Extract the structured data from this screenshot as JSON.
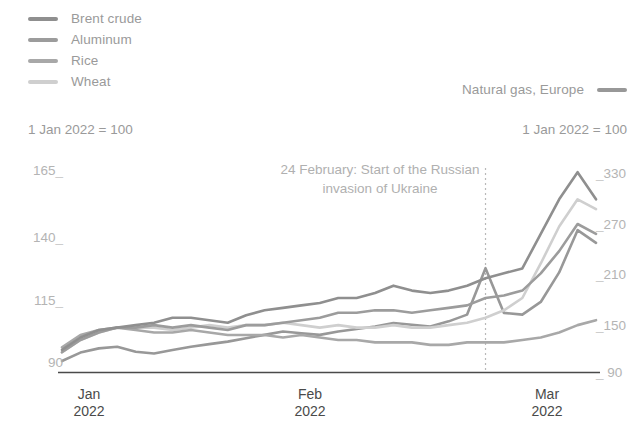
{
  "legend": {
    "left_items": [
      {
        "label": "Brent crude",
        "color": "#8f8f8f"
      },
      {
        "label": "Aluminum",
        "color": "#9c9c9c"
      },
      {
        "label": "Rice",
        "color": "#a8a8a8"
      },
      {
        "label": "Wheat",
        "color": "#cfcfcf"
      }
    ],
    "right_item": {
      "label": "Natural gas, Europe",
      "color": "#989898"
    }
  },
  "axis": {
    "left_header": "1 Jan 2022 = 100",
    "right_header": "1 Jan 2022 = 100",
    "left_ticks": [
      "165",
      "140",
      "115",
      "90"
    ],
    "right_ticks": [
      "330",
      "270",
      "210",
      "150",
      "90"
    ],
    "x_labels": [
      {
        "month": "Jan",
        "year": "2022"
      },
      {
        "month": "Feb",
        "year": "2022"
      },
      {
        "month": "Mar",
        "year": "2022"
      }
    ]
  },
  "annotation": {
    "line1": "24 February: Start of the Russian",
    "line2": "invasion of Ukraine"
  },
  "chart_data": {
    "type": "line",
    "title": "",
    "xlabel": "",
    "ylabel": "1 Jan 2022 = 100",
    "grid": false,
    "legend_position": "top-left",
    "ylim_left": [
      82,
      172
    ],
    "ylim_right": [
      82,
      345
    ],
    "left_axis_ticks": [
      90,
      115,
      140,
      165
    ],
    "right_axis_ticks": [
      90,
      150,
      210,
      270,
      330
    ],
    "x_range": [
      "2022-01-01",
      "2022-03-10"
    ],
    "x_tick_labels": [
      "Jan 2022",
      "Feb 2022",
      "Mar 2022"
    ],
    "event_line": {
      "label": "24 February: Start of the Russian invasion of Ukraine",
      "x": "2022-02-24"
    },
    "x": [
      "2022-01-03",
      "2022-01-05",
      "2022-01-07",
      "2022-01-10",
      "2022-01-12",
      "2022-01-14",
      "2022-01-17",
      "2022-01-19",
      "2022-01-21",
      "2022-01-24",
      "2022-01-26",
      "2022-01-28",
      "2022-01-31",
      "2022-02-02",
      "2022-02-04",
      "2022-02-07",
      "2022-02-09",
      "2022-02-11",
      "2022-02-14",
      "2022-02-16",
      "2022-02-18",
      "2022-02-21",
      "2022-02-23",
      "2022-02-24",
      "2022-02-25",
      "2022-02-28",
      "2022-03-02",
      "2022-03-04",
      "2022-03-07",
      "2022-03-09"
    ],
    "series": [
      {
        "name": "Brent crude",
        "axis": "left",
        "color": "#8f8f8f",
        "values": [
          91,
          96,
          99,
          100,
          101,
          102,
          104,
          104,
          103,
          102,
          105,
          107,
          108,
          109,
          110,
          112,
          112,
          114,
          117,
          115,
          114,
          115,
          117,
          120,
          122,
          124,
          138,
          152,
          163,
          152
        ]
      },
      {
        "name": "Aluminum",
        "axis": "left",
        "color": "#9c9c9c",
        "values": [
          90,
          95,
          98,
          100,
          100,
          101,
          100,
          101,
          100,
          99,
          101,
          101,
          102,
          103,
          104,
          106,
          106,
          107,
          107,
          106,
          107,
          108,
          109,
          112,
          113,
          115,
          122,
          131,
          142,
          138
        ]
      },
      {
        "name": "Rice",
        "axis": "left",
        "color": "#a8a8a8",
        "values": [
          92,
          97,
          99,
          100,
          99,
          98,
          98,
          99,
          98,
          97,
          97,
          97,
          96,
          97,
          96,
          95,
          95,
          94,
          94,
          94,
          93,
          93,
          94,
          94,
          94,
          95,
          96,
          98,
          101,
          103
        ]
      },
      {
        "name": "Wheat",
        "axis": "left",
        "color": "#cfcfcf",
        "values": [
          90,
          95,
          98,
          100,
          100,
          100,
          99,
          100,
          101,
          100,
          101,
          101,
          102,
          101,
          100,
          101,
          100,
          100,
          101,
          100,
          100,
          101,
          102,
          104,
          107,
          112,
          126,
          141,
          152,
          148
        ]
      },
      {
        "name": "Natural gas, Europe",
        "axis": "right",
        "color": "#989898",
        "values": [
          95,
          105,
          110,
          112,
          106,
          104,
          108,
          112,
          115,
          118,
          122,
          126,
          130,
          128,
          126,
          130,
          133,
          136,
          140,
          138,
          136,
          142,
          150,
          205,
          152,
          150,
          165,
          200,
          250,
          235
        ]
      }
    ]
  }
}
